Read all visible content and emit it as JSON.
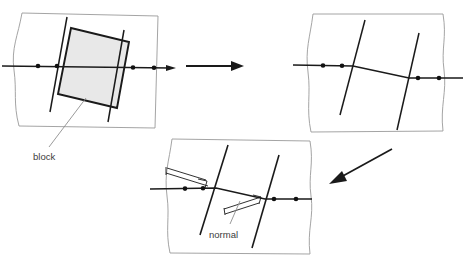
{
  "figure": {
    "type": "schematic-diagram",
    "title_visible": false,
    "background_color": "#ffffff",
    "stroke_color": "#1a1a1a",
    "panel_outline_color": "#9a9a9a",
    "block_fill_color": "#e8e8e8",
    "leader_line_color": "#8f8f8f",
    "label_text_color": "#3b3b3b"
  },
  "labels": {
    "block": "block",
    "normal": "normal"
  },
  "panels": [
    {
      "id": "panel-initial",
      "position": "top-left",
      "box": {
        "x": 13,
        "y": 13,
        "width": 146,
        "height": 115
      },
      "description": "fault plane with shaded block straddling a horizontal marker line",
      "horizontal_line": {
        "y": 66,
        "x1": 2,
        "x2": 176,
        "arrow_end": true
      },
      "markers_on_line_x": [
        38,
        57,
        132,
        153
      ],
      "block": {
        "corners": [
          [
            71,
            28
          ],
          [
            129,
            42
          ],
          [
            117,
            108
          ],
          [
            58,
            94
          ]
        ],
        "fill": "#e8e8e8",
        "label": "block"
      },
      "fracture_lines": [
        {
          "x1": 67,
          "y1": 17,
          "x2": 50,
          "y2": 112
        },
        {
          "x1": 124,
          "y1": 30,
          "x2": 108,
          "y2": 122
        }
      ]
    },
    {
      "id": "panel-displaced",
      "position": "top-right",
      "box": {
        "x": 305,
        "y": 13,
        "width": 139,
        "height": 119
      },
      "description": "same region after block removal; marker line offset across two fractures",
      "markers_on_line_x": [
        323,
        342,
        418,
        438
      ],
      "fracture_lines": [
        {
          "x1": 365,
          "y1": 20,
          "x2": 340,
          "y2": 115
        },
        {
          "x1": 419,
          "y1": 33,
          "x2": 397,
          "y2": 130
        }
      ]
    },
    {
      "id": "panel-normal",
      "position": "bottom-center",
      "box": {
        "x": 163,
        "y": 138,
        "width": 149,
        "height": 118
      },
      "description": "close-up showing fracture normals perpendicular to the fracture planes",
      "markers_on_line_x": [
        185,
        202,
        272,
        295
      ],
      "fracture_lines": [
        {
          "x1": 228,
          "y1": 145,
          "x2": 200,
          "y2": 235
        },
        {
          "x1": 279,
          "y1": 155,
          "x2": 252,
          "y2": 248
        }
      ],
      "normals": 2,
      "right_angle_marks": 2,
      "label": "normal"
    }
  ],
  "arrows": [
    {
      "id": "arrow-right",
      "from": [
        186,
        66
      ],
      "to": [
        243,
        66
      ],
      "direction": "right"
    },
    {
      "id": "arrow-diagonal",
      "from": [
        392,
        149
      ],
      "to": [
        330,
        183
      ],
      "direction": "down-left"
    }
  ]
}
